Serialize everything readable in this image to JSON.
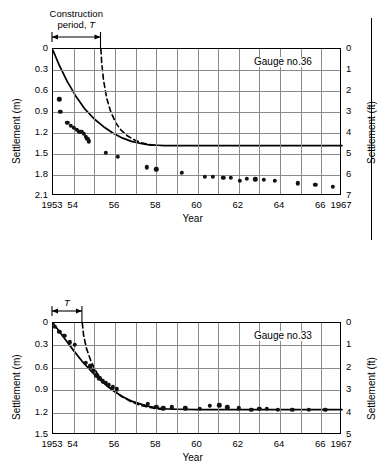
{
  "figure": {
    "background": "#ffffff",
    "axis_color": "#000000",
    "grid_color": "#8a8a8a",
    "marker_color": "#111111"
  },
  "panels": [
    {
      "id": "gauge-36",
      "gauge_label": "Gauge no.36",
      "annotation": {
        "line1": "Construction",
        "line2_prefix": "period, ",
        "line2_symbol": "T",
        "span_start_year": 1953,
        "span_end_year": 1955.35
      },
      "chart_data": {
        "type": "scatter",
        "title": "Gauge no.36",
        "xlabel": "Year",
        "ylabel": "Settlement (m)",
        "ylabel_right": "Settlement (ft)",
        "xlim": [
          1953,
          1967
        ],
        "ylim": [
          0,
          2.1
        ],
        "ylim_right": [
          0,
          7
        ],
        "y_inverted": true,
        "grid": true,
        "legend": "none",
        "xticks": [
          1953,
          1954,
          1956,
          1958,
          1960,
          1962,
          1964,
          1966,
          1967
        ],
        "xticklabels": [
          "1953",
          "54",
          "56",
          "58",
          "60",
          "62",
          "64",
          "66",
          "1967"
        ],
        "xgridlines": [
          1953,
          1954,
          1955,
          1956,
          1957,
          1958,
          1959,
          1960,
          1961,
          1962,
          1963,
          1964,
          1965,
          1966,
          1967
        ],
        "yticks": [
          0,
          0.3,
          0.6,
          0.9,
          1.2,
          1.5,
          1.8,
          2.1
        ],
        "yticklabels": [
          "0",
          "0.3",
          "0.6",
          "0.9",
          "1.2",
          "1.5",
          "1.8",
          "2.1"
        ],
        "yticks_right": [
          0,
          1,
          2,
          3,
          4,
          5,
          6,
          7
        ],
        "yticklabels_right": [
          "0",
          "1",
          "2",
          "3",
          "4",
          "5",
          "6",
          "7"
        ],
        "series": [
          {
            "name": "measured settlement",
            "style": "points",
            "x": [
              1953.3,
              1953.35,
              1953.7,
              1953.85,
              1954.0,
              1954.15,
              1954.28,
              1954.38,
              1954.48,
              1954.58,
              1954.66,
              1954.74,
              1955.55,
              1956.15,
              1957.55,
              1958.0,
              1959.25,
              1960.35,
              1960.75,
              1961.25,
              1961.6,
              1962.05,
              1962.4,
              1962.8,
              1963.2,
              1963.75,
              1964.85,
              1965.7,
              1966.55
            ],
            "y": [
              0.72,
              0.9,
              1.05,
              1.1,
              1.13,
              1.15,
              1.18,
              1.18,
              1.21,
              1.25,
              1.28,
              1.32,
              1.48,
              1.54,
              1.69,
              1.72,
              1.77,
              1.83,
              1.83,
              1.84,
              1.84,
              1.88,
              1.85,
              1.86,
              1.87,
              1.88,
              1.92,
              1.94,
              1.97
            ]
          },
          {
            "name": "theoretical curve (solid)",
            "style": "solid-line",
            "x": [
              1953.0,
              1953.3,
              1953.7,
              1954.1,
              1954.55,
              1955.0,
              1955.45,
              1955.9,
              1956.35,
              1956.8,
              1957.25,
              1957.65,
              1958.05,
              1958.4,
              1958.7,
              1959.2,
              1961.0,
              1963.0,
              1965.0,
              1967.0
            ],
            "y": [
              0.02,
              0.23,
              0.47,
              0.67,
              0.86,
              1.0,
              1.11,
              1.2,
              1.27,
              1.32,
              1.35,
              1.37,
              1.375,
              1.38,
              1.38,
              1.38,
              1.38,
              1.38,
              1.38,
              1.38
            ]
          },
          {
            "name": "theoretical curve (dashed)",
            "style": "dashed-line",
            "x": [
              1955.32,
              1955.36,
              1955.45,
              1955.6,
              1955.8,
              1956.05,
              1956.3,
              1956.6,
              1956.95,
              1957.3,
              1957.65,
              1957.95
            ],
            "y": [
              0.0,
              0.2,
              0.45,
              0.7,
              0.9,
              1.06,
              1.16,
              1.24,
              1.3,
              1.34,
              1.365,
              1.375
            ]
          }
        ]
      }
    },
    {
      "id": "gauge-33",
      "gauge_label": "Gauge no.33",
      "annotation": {
        "line1": "",
        "line2_prefix": "",
        "line2_symbol": "T",
        "span_start_year": 1953,
        "span_end_year": 1954.45
      },
      "chart_data": {
        "type": "scatter",
        "title": "Gauge no.33",
        "xlabel": "Year",
        "ylabel": "Settlement (m)",
        "ylabel_right": "Settlement (ft)",
        "xlim": [
          1953,
          1967
        ],
        "ylim": [
          0,
          1.5
        ],
        "ylim_right": [
          0,
          5
        ],
        "y_inverted": true,
        "grid": true,
        "legend": "none",
        "xticks": [
          1953,
          1954,
          1956,
          1958,
          1960,
          1962,
          1964,
          1966,
          1967
        ],
        "xticklabels": [
          "1953",
          "54",
          "56",
          "58",
          "60",
          "62",
          "64",
          "66",
          "1967"
        ],
        "xgridlines": [
          1953,
          1954,
          1955,
          1956,
          1957,
          1958,
          1959,
          1960,
          1961,
          1962,
          1963,
          1964,
          1965,
          1966,
          1967
        ],
        "yticks": [
          0,
          0.3,
          0.6,
          0.9,
          1.2,
          1.5
        ],
        "yticklabels": [
          "0",
          "0.3",
          "0.6",
          "0.9",
          "1.2",
          "1.5"
        ],
        "yticks_right": [
          0,
          1,
          2,
          3,
          4,
          5
        ],
        "yticklabels_right": [
          "0",
          "1",
          "2",
          "3",
          "4",
          "5"
        ],
        "series": [
          {
            "name": "measured settlement",
            "style": "points",
            "x": [
              1953.1,
              1953.3,
              1953.55,
              1953.8,
              1954.05,
              1954.6,
              1954.8,
              1954.95,
              1955.1,
              1955.25,
              1955.4,
              1955.55,
              1955.7,
              1955.9,
              1956.1,
              1957.6,
              1958.0,
              1958.35,
              1958.75,
              1959.4,
              1960.1,
              1960.6,
              1961.05,
              1961.45,
              1962.0,
              1962.6,
              1963.0,
              1963.35,
              1963.9,
              1964.6,
              1965.4,
              1966.2
            ],
            "y": [
              0.05,
              0.12,
              0.17,
              0.26,
              0.29,
              0.53,
              0.58,
              0.64,
              0.7,
              0.74,
              0.78,
              0.8,
              0.83,
              0.86,
              0.89,
              1.08,
              1.12,
              1.14,
              1.13,
              1.14,
              1.15,
              1.11,
              1.1,
              1.13,
              1.14,
              1.16,
              1.15,
              1.15,
              1.16,
              1.16,
              1.16,
              1.16
            ]
          },
          {
            "name": "theoretical curve (solid)",
            "style": "solid-line",
            "x": [
              1953.0,
              1953.3,
              1953.65,
              1954.0,
              1954.4,
              1954.8,
              1955.2,
              1955.6,
              1956.0,
              1956.4,
              1956.85,
              1957.3,
              1957.7,
              1958.1,
              1958.5,
              1959.0,
              1960.0,
              1962.0,
              1964.0,
              1967.0
            ],
            "y": [
              0.0,
              0.11,
              0.24,
              0.37,
              0.51,
              0.63,
              0.74,
              0.84,
              0.92,
              0.99,
              1.05,
              1.09,
              1.12,
              1.14,
              1.15,
              1.155,
              1.16,
              1.16,
              1.16,
              1.16
            ]
          },
          {
            "name": "theoretical curve (dashed)",
            "style": "dashed-line",
            "x": [
              1954.42,
              1954.48,
              1954.62,
              1954.85,
              1955.15,
              1955.5,
              1955.9,
              1956.3,
              1956.75,
              1957.2,
              1957.65,
              1958.05,
              1958.45
            ],
            "y": [
              0.0,
              0.16,
              0.34,
              0.52,
              0.68,
              0.8,
              0.9,
              0.98,
              1.05,
              1.1,
              1.13,
              1.15,
              1.16
            ]
          }
        ]
      }
    }
  ]
}
